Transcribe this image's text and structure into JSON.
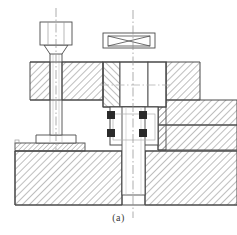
{
  "figure": {
    "caption": "(a)",
    "type": "mechanical-sectional-assembly-drawing",
    "background_color": "#ffffff",
    "line_color": "#4a4a4a",
    "hatch_color": "#6e6e6e",
    "solid_fill_color": "#2a2a2a",
    "centerline_color": "#8a8a8a",
    "canvas": {
      "width": 237,
      "height": 235
    }
  },
  "components": {
    "left_bolt": {
      "name": "Hex head clamping bolt",
      "head_label": "hex-head",
      "shank_label": "shank",
      "foot_label": "t-foot",
      "head": {
        "x": 40,
        "y": 22,
        "width": 32,
        "height": 23
      },
      "neck": {
        "x": 46,
        "y": 45,
        "width": 20,
        "height": 8
      },
      "shank": {
        "x": 50,
        "y": 53,
        "width": 12,
        "height": 82
      },
      "foot": {
        "x": 36,
        "y": 135,
        "width": 40,
        "height": 8
      },
      "centerline_x": 56
    },
    "top_nut": {
      "name": "Crossed rectangle nut symbol",
      "outer": {
        "x": 103,
        "y": 33,
        "width": 52,
        "height": 15
      },
      "inner": {
        "x": 108,
        "y": 36,
        "width": 42,
        "height": 10
      },
      "cross": true
    },
    "center_body": {
      "name": "Central body / spindle housing",
      "upper_block": {
        "x": 103,
        "y": 62,
        "width": 63,
        "height": 45
      },
      "inner_bore": {
        "x": 120,
        "y": 62,
        "width": 28,
        "height": 45
      },
      "lower_collar": {
        "x": 110,
        "y": 107,
        "width": 48,
        "height": 38
      },
      "shaft": {
        "x": 122,
        "y": 107,
        "width": 23,
        "height": 88
      },
      "centerline_x": 133
    },
    "keys": {
      "name": "Sectioned key / pin elements",
      "count": 4,
      "size": 8,
      "positions": [
        {
          "x": 107,
          "y": 111
        },
        {
          "x": 139,
          "y": 111
        },
        {
          "x": 107,
          "y": 129
        },
        {
          "x": 139,
          "y": 129
        }
      ]
    },
    "upper_left_plate": {
      "name": "Upper left hatched plate",
      "x": 30,
      "y": 62,
      "width": 73,
      "height": 38
    },
    "upper_right_plate": {
      "name": "Upper right hatched plate",
      "x": 166,
      "y": 62,
      "width": 34,
      "height": 38
    },
    "mid_right_block": {
      "name": "Mid right stepped hatched block",
      "x": 158,
      "y": 100,
      "width": 79,
      "height": 25
    },
    "lower_right_block": {
      "name": "Lower right stepped hatched block",
      "x": 158,
      "y": 125,
      "width": 79,
      "height": 25
    },
    "thin_plate": {
      "name": "Thin support plate under bolt foot",
      "x": 15,
      "y": 143,
      "width": 70,
      "height": 8
    },
    "base_block": {
      "name": "Base / bed block",
      "x": 15,
      "y": 151,
      "width": 222,
      "height": 54
    }
  },
  "centerlines": [
    {
      "name": "bolt-centerline",
      "x": 56,
      "y1": 8,
      "y2": 150
    },
    {
      "name": "body-centerline",
      "x": 133,
      "y1": 10,
      "y2": 218
    },
    {
      "name": "body-horizontal-centerline",
      "y": 85,
      "x1": 100,
      "x2": 170
    }
  ]
}
